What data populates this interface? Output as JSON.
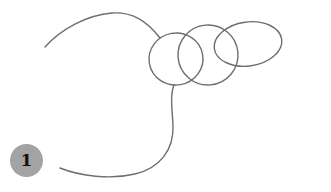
{
  "figure": {
    "stroke_color": "#6e6e6e",
    "background": "#ffffff"
  },
  "badge": {
    "label": "1",
    "color": "#a3a3a3",
    "text_color": "#111111"
  },
  "shapes": {
    "top_arc": "line-start-arc",
    "loops": [
      "loop-1",
      "loop-2",
      "loop-3"
    ],
    "tail": "line-end-tail"
  }
}
